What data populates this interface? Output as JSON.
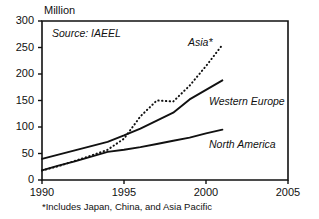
{
  "chart_data": {
    "type": "line",
    "title": "",
    "ylabel": "Million",
    "xlabel": "",
    "xlim": [
      1990,
      2005
    ],
    "ylim": [
      0,
      300
    ],
    "grid": false,
    "legend_position": "inline-annotations",
    "x_ticks": [
      "1990",
      "1995",
      "2000",
      "2005"
    ],
    "y_ticks": [
      "0",
      "50",
      "100",
      "150",
      "200",
      "250",
      "300"
    ],
    "x": [
      1990,
      1991,
      1992,
      1993,
      1994,
      1995,
      1996,
      1997,
      1998,
      1999,
      2000,
      2001
    ],
    "series": [
      {
        "name": "Asia*",
        "style": "dotted",
        "color": "#111111",
        "values": [
          18,
          26,
          36,
          46,
          57,
          78,
          120,
          150,
          148,
          178,
          215,
          255
        ]
      },
      {
        "name": "Western Europe",
        "style": "solid",
        "color": "#111111",
        "values": [
          40,
          48,
          56,
          64,
          72,
          84,
          97,
          112,
          127,
          152,
          170,
          188
        ]
      },
      {
        "name": "North America",
        "style": "solid",
        "color": "#111111",
        "values": [
          18,
          27,
          35,
          44,
          53,
          57,
          62,
          68,
          74,
          80,
          88,
          95
        ]
      }
    ],
    "annotations": [
      {
        "id": "source",
        "text": "Source: IAEEL"
      },
      {
        "id": "footnote",
        "text": "*Includes Japan, China, and Asia Pacific"
      }
    ]
  },
  "labels": {
    "y_unit": "Million",
    "source": "Source: IAEEL",
    "footnote": "*Includes Japan, China, and Asia Pacific",
    "series_asia": "Asia*",
    "series_western_europe": "Western Europe",
    "series_north_america": "North America"
  },
  "ticks": {
    "y": [
      "300",
      "250",
      "200",
      "150",
      "100",
      "50",
      "0"
    ],
    "x": [
      "1990",
      "1995",
      "2000",
      "2005"
    ]
  },
  "colors": {
    "ink": "#111111",
    "background": "#ffffff"
  }
}
